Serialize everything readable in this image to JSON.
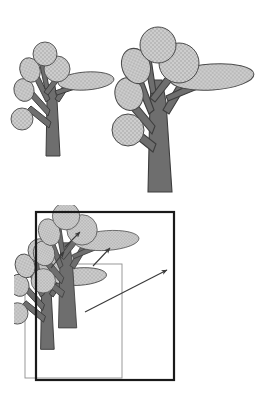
{
  "figure": {
    "title": "",
    "background_color": "#ffffff",
    "panels": [
      {
        "id": "top-left-tree",
        "name": "small-tree",
        "label": "",
        "description": "small stylized tree with stippled elliptical foliage blobs and a forked trunk"
      },
      {
        "id": "top-right-tree",
        "name": "large-tree",
        "label": "",
        "description": "larger stylized tree, a scaled copy of the small tree"
      },
      {
        "id": "bottom-overlay",
        "name": "overlay-panel",
        "label": "",
        "description": "both trees superimposed with nested bounding boxes and correspondence arrows"
      }
    ]
  },
  "colors": {
    "foliage_fill": "#c9c9c9",
    "foliage_stipple": "#9a9a9a",
    "foliage_stroke": "#4a4a4a",
    "trunk_fill": "#6e6e6e",
    "trunk_stroke": "#3d3d3d",
    "outer_box_stroke": "#1a1a1a",
    "inner_box_stroke": "#8e8e8e",
    "arrow_stroke": "#3a3a3a",
    "background": "#ffffff"
  },
  "small_tree": {
    "trunk": {
      "base_left": 46,
      "base_right": 60,
      "base_y": 156,
      "top_x": 52,
      "top_y": 82,
      "width_top": 10
    },
    "branches": [
      {
        "name": "branch-left-low",
        "from": [
          52,
          120
        ],
        "to": [
          28,
          104
        ]
      },
      {
        "name": "branch-left-mid",
        "from": [
          52,
          108
        ],
        "to": [
          30,
          88
        ]
      },
      {
        "name": "branch-fork-left",
        "from": [
          52,
          95
        ],
        "to": [
          36,
          72
        ]
      },
      {
        "name": "branch-fork-right",
        "from": [
          52,
          95
        ],
        "to": [
          70,
          74
        ]
      },
      {
        "name": "branch-right-ellipse",
        "from": [
          60,
          86
        ],
        "to": [
          80,
          80
        ]
      },
      {
        "name": "branch-upper-center",
        "from": [
          50,
          80
        ],
        "to": [
          44,
          58
        ]
      }
    ],
    "foliage": [
      {
        "name": "blob-top",
        "cx": 45,
        "cy": 54,
        "rx": 12,
        "ry": 12,
        "rot": 0
      },
      {
        "name": "blob-upper-left",
        "cx": 30,
        "cy": 70,
        "rx": 10,
        "ry": 12,
        "rot": -20
      },
      {
        "name": "blob-upper-right",
        "cx": 57,
        "cy": 69,
        "rx": 13,
        "ry": 13,
        "rot": 0
      },
      {
        "name": "blob-mid-left",
        "cx": 24,
        "cy": 90,
        "rx": 10,
        "ry": 11,
        "rot": -15
      },
      {
        "name": "blob-low-left",
        "cx": 22,
        "cy": 119,
        "rx": 11,
        "ry": 11,
        "rot": 0
      },
      {
        "name": "blob-ellipse-right",
        "cx": 86,
        "cy": 81,
        "rx": 28,
        "ry": 9,
        "rot": -4
      }
    ]
  },
  "large_tree": {
    "trunk": {
      "base_left": 148,
      "base_right": 172,
      "base_y": 192,
      "top_x": 157,
      "top_y": 76,
      "width_top": 14
    },
    "branches": [
      {
        "name": "branch-left-low",
        "from": [
          158,
          140
        ],
        "to": [
          126,
          120
        ]
      },
      {
        "name": "branch-left-mid",
        "from": [
          158,
          122
        ],
        "to": [
          128,
          94
        ]
      },
      {
        "name": "branch-fork-left",
        "from": [
          158,
          104
        ],
        "to": [
          137,
          68
        ]
      },
      {
        "name": "branch-fork-right",
        "from": [
          158,
          104
        ],
        "to": [
          185,
          74
        ]
      },
      {
        "name": "branch-right-ellipse",
        "from": [
          170,
          90
        ],
        "to": [
          196,
          80
        ]
      },
      {
        "name": "branch-upper-center",
        "from": [
          156,
          88
        ],
        "to": [
          150,
          52
        ]
      }
    ],
    "foliage": [
      {
        "name": "blob-top",
        "cx": 158,
        "cy": 45,
        "rx": 18,
        "ry": 18,
        "rot": 0
      },
      {
        "name": "blob-upper-left",
        "cx": 136,
        "cy": 66,
        "rx": 14,
        "ry": 18,
        "rot": -20
      },
      {
        "name": "blob-upper-right",
        "cx": 179,
        "cy": 63,
        "rx": 20,
        "ry": 20,
        "rot": 0
      },
      {
        "name": "blob-mid-left",
        "cx": 129,
        "cy": 94,
        "rx": 14,
        "ry": 16,
        "rot": -15
      },
      {
        "name": "blob-low-left",
        "cx": 128,
        "cy": 130,
        "rx": 16,
        "ry": 16,
        "rot": 0
      },
      {
        "name": "blob-ellipse-right",
        "cx": 212,
        "cy": 77,
        "rx": 42,
        "ry": 13,
        "rot": -4
      }
    ]
  },
  "overlay": {
    "outer_box": {
      "x": 36,
      "y": 212,
      "width": 138,
      "height": 168,
      "stroke_width": 2.2
    },
    "inner_box": {
      "x": 25,
      "y": 264,
      "width": 97,
      "height": 114,
      "stroke_width": 0.9
    },
    "small_tree_offset": {
      "dx": -25,
      "dy": 210
    },
    "large_tree_offset": {
      "dx": -12,
      "dy": 188
    },
    "arrows": [
      {
        "name": "arrow-blob-top",
        "from": [
          65,
          247
        ],
        "to": [
          80,
          232
        ]
      },
      {
        "name": "arrow-blob-upper-right",
        "from": [
          93,
          266
        ],
        "to": [
          110,
          248
        ]
      },
      {
        "name": "arrow-blob-upper-left",
        "from": [
          51,
          268
        ],
        "to": [
          64,
          252
        ]
      },
      {
        "name": "arrow-ellipse-tip",
        "from": [
          85,
          312
        ],
        "to": [
          167,
          270
        ]
      }
    ]
  }
}
